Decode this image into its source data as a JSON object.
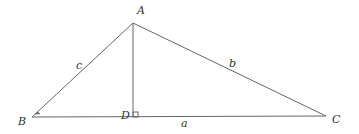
{
  "diagram": {
    "type": "geometry",
    "points": {
      "A": {
        "label": "A",
        "x": 133,
        "y": 23
      },
      "B": {
        "label": "B",
        "x": 32,
        "y": 117
      },
      "C": {
        "label": "C",
        "x": 326,
        "y": 116
      },
      "D": {
        "label": "D",
        "x": 133,
        "y": 117
      }
    },
    "sides": {
      "a": {
        "label": "a",
        "from": "B",
        "to": "C"
      },
      "b": {
        "label": "b",
        "from": "A",
        "to": "C"
      },
      "c": {
        "label": "c",
        "from": "A",
        "to": "B"
      }
    },
    "segments": [
      {
        "from": "A",
        "to": "B"
      },
      {
        "from": "A",
        "to": "C"
      },
      {
        "from": "B",
        "to": "C"
      },
      {
        "from": "A",
        "to": "D"
      }
    ],
    "markers": {
      "right_angle_at": "D",
      "angle_mark_at": "B"
    }
  }
}
